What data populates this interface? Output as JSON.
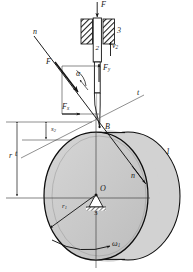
{
  "figure": {
    "colors": {
      "cylinder_face": "#c9c9c9",
      "cylinder_side": "#d8d8d8",
      "outline": "#000000",
      "thin_line": "#4a4a4a",
      "hatch": "#2b2b2b",
      "background": "#ffffff"
    }
  },
  "labels": {
    "applied_force": "F",
    "member_3_top": "3",
    "member_2": "2",
    "velocity_2": "v",
    "velocity_2_sub": "2",
    "force_resultant": "F",
    "angle_alpha": "α",
    "force_y": "F",
    "force_y_sub": "y",
    "force_x": "F",
    "force_x_sub": "x",
    "contact_point": "B",
    "normal_axis_upper": "n",
    "normal_axis_lower": "n",
    "tangent_axis_upper": "t",
    "tangent_axis_lower": "t",
    "displacement_s2": "s",
    "displacement_s2_sub": "2",
    "radius_r": "r",
    "radius_r1": "r",
    "radius_r1_sub": "1",
    "center_O": "O",
    "pivot_3": "3",
    "member_1": "1",
    "omega_1": "ω",
    "omega_1_sub": "1"
  },
  "geometry": {
    "contact_point_B": {
      "x": 100,
      "y": 127
    },
    "cam_center_O": {
      "x": 96,
      "y": 198
    },
    "cam_radius_px": 62,
    "contact_angle_deg": 38,
    "dimension_r_top_y": 122,
    "dimension_r_bottom_y": 198,
    "dimension_s2_top_y": 122,
    "dimension_s2_bottom_y": 140
  }
}
